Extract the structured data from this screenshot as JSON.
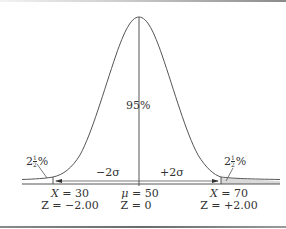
{
  "diagram": {
    "type": "normal-distribution",
    "center_label": "95%",
    "left_tail": {
      "whole": "2",
      "num": "1",
      "den": "2",
      "pct": "%"
    },
    "right_tail": {
      "whole": "2",
      "num": "1",
      "den": "2",
      "pct": "%"
    },
    "left_span": "−2σ",
    "right_span": "+2σ",
    "left_x": {
      "var": "X",
      "eq": " = 30"
    },
    "left_z": "Z = −2.00",
    "mean_x": {
      "var": "μ",
      "eq": " = 50"
    },
    "mean_z": "Z = 0",
    "right_x": {
      "var": "X",
      "eq": " = 70"
    },
    "right_z": "Z = +2.00",
    "colors": {
      "line": "#555555",
      "tail_shade": "#d9d9d9",
      "text": "#333333"
    }
  }
}
